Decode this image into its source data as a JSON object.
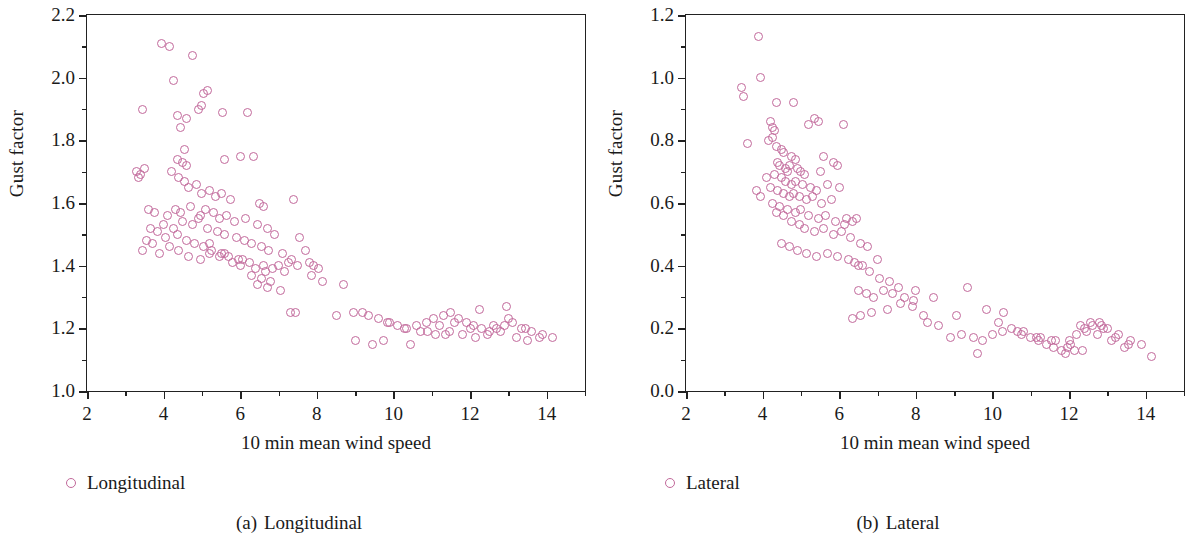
{
  "figure": {
    "marker_color": "#c2699b",
    "axis_color": "#222222"
  },
  "panels": [
    {
      "id": "a",
      "caption_number": "(a)",
      "caption_text": "Longitudinal",
      "legend_label": "Longitudinal",
      "xlabel": "10 min mean wind speed",
      "ylabel": "Gust factor",
      "xticks": [
        "2",
        "4",
        "6",
        "8",
        "10",
        "12",
        "14"
      ],
      "yticks": [
        "1.0",
        "1.2",
        "1.4",
        "1.6",
        "1.8",
        "2.0",
        "2.2"
      ]
    },
    {
      "id": "b",
      "caption_number": "(b)",
      "caption_text": "Lateral",
      "legend_label": "Lateral",
      "xlabel": "10 min mean wind speed",
      "ylabel": "Gust factor",
      "xticks": [
        "2",
        "4",
        "6",
        "8",
        "10",
        "12",
        "14"
      ],
      "yticks": [
        "0.0",
        "0.2",
        "0.4",
        "0.6",
        "0.8",
        "1.0",
        "1.2"
      ]
    }
  ],
  "chart_data": [
    {
      "type": "scatter",
      "panel": "a",
      "title": "(a) Longitudinal",
      "xlabel": "10 min mean wind speed",
      "ylabel": "Gust factor",
      "xlim": [
        2,
        15
      ],
      "ylim": [
        1.0,
        2.2
      ],
      "xticks": [
        2,
        4,
        6,
        8,
        10,
        12,
        14
      ],
      "yticks": [
        1.0,
        1.2,
        1.4,
        1.6,
        1.8,
        2.0,
        2.2
      ],
      "xminor_step": 1,
      "yminor_step": 0.1,
      "grid": false,
      "legend": [
        {
          "name": "Longitudinal",
          "marker": "open-circle",
          "color": "#c2699b"
        }
      ],
      "legend_position": "below-axis-left",
      "series": [
        {
          "name": "Longitudinal",
          "x": [
            3.95,
            4.15,
            4.75,
            5.55,
            4.25,
            5.05,
            5.15,
            3.45,
            4.9,
            5.0,
            4.6,
            4.35,
            6.2,
            4.45,
            4.55,
            3.3,
            3.4,
            4.35,
            4.5,
            4.6,
            5.6,
            6.0,
            6.35,
            3.5,
            3.35,
            4.2,
            4.4,
            4.55,
            4.65,
            4.85,
            5.0,
            5.2,
            5.35,
            5.5,
            5.75,
            6.5,
            6.6,
            7.4,
            3.6,
            3.75,
            4.1,
            4.3,
            4.45,
            4.7,
            4.95,
            5.1,
            5.3,
            5.45,
            5.65,
            5.85,
            6.15,
            6.45,
            6.7,
            6.9,
            7.55,
            3.65,
            3.85,
            4.0,
            4.25,
            4.5,
            4.75,
            4.9,
            5.15,
            5.4,
            5.6,
            5.9,
            6.1,
            6.3,
            6.55,
            6.75,
            7.1,
            7.7,
            3.55,
            3.7,
            4.05,
            4.35,
            4.6,
            4.8,
            5.05,
            5.25,
            5.5,
            5.7,
            6.05,
            6.25,
            6.6,
            6.85,
            7.25,
            7.9,
            3.45,
            3.9,
            4.15,
            4.4,
            4.65,
            4.95,
            5.2,
            5.45,
            5.8,
            6.0,
            6.4,
            6.65,
            7.0,
            7.35,
            7.8,
            8.05,
            5.2,
            5.6,
            5.95,
            6.3,
            6.55,
            6.8,
            7.15,
            7.5,
            7.85,
            8.15,
            6.45,
            6.7,
            7.05,
            7.45,
            8.7,
            8.95,
            9.35,
            9.6,
            9.85,
            10.1,
            10.35,
            10.6,
            10.85,
            11.05,
            11.3,
            11.5,
            11.7,
            11.9,
            12.1,
            12.3,
            12.5,
            12.7,
            12.9,
            13.1,
            13.35,
            13.6,
            13.9,
            14.15,
            9.0,
            9.45,
            9.9,
            10.3,
            10.7,
            11.1,
            11.45,
            11.8,
            12.15,
            12.45,
            12.8,
            13.2,
            13.5,
            13.8,
            9.75,
            10.45,
            11.2,
            11.6,
            12.0,
            12.6,
            13.0,
            13.45,
            10.9,
            11.35,
            12.25,
            12.95,
            7.3,
            8.5,
            9.2
          ],
          "y": [
            2.11,
            2.1,
            2.07,
            1.89,
            1.99,
            1.95,
            1.96,
            1.9,
            1.9,
            1.91,
            1.87,
            1.88,
            1.89,
            1.84,
            1.77,
            1.7,
            1.69,
            1.74,
            1.73,
            1.72,
            1.74,
            1.75,
            1.75,
            1.71,
            1.68,
            1.7,
            1.68,
            1.67,
            1.65,
            1.66,
            1.63,
            1.64,
            1.62,
            1.63,
            1.61,
            1.6,
            1.59,
            1.61,
            1.58,
            1.57,
            1.56,
            1.58,
            1.57,
            1.59,
            1.56,
            1.58,
            1.57,
            1.55,
            1.56,
            1.54,
            1.55,
            1.53,
            1.52,
            1.5,
            1.49,
            1.52,
            1.51,
            1.53,
            1.52,
            1.54,
            1.53,
            1.55,
            1.52,
            1.51,
            1.5,
            1.49,
            1.48,
            1.47,
            1.46,
            1.45,
            1.44,
            1.45,
            1.48,
            1.47,
            1.49,
            1.5,
            1.48,
            1.47,
            1.46,
            1.45,
            1.44,
            1.43,
            1.42,
            1.41,
            1.4,
            1.39,
            1.41,
            1.4,
            1.45,
            1.44,
            1.46,
            1.45,
            1.43,
            1.42,
            1.44,
            1.43,
            1.41,
            1.4,
            1.39,
            1.38,
            1.4,
            1.42,
            1.41,
            1.39,
            1.47,
            1.44,
            1.42,
            1.37,
            1.36,
            1.35,
            1.38,
            1.4,
            1.37,
            1.35,
            1.34,
            1.33,
            1.32,
            1.25,
            1.34,
            1.25,
            1.24,
            1.23,
            1.22,
            1.21,
            1.2,
            1.21,
            1.22,
            1.23,
            1.24,
            1.25,
            1.23,
            1.22,
            1.21,
            1.2,
            1.19,
            1.2,
            1.21,
            1.22,
            1.2,
            1.19,
            1.18,
            1.17,
            1.16,
            1.15,
            1.22,
            1.2,
            1.19,
            1.18,
            1.19,
            1.18,
            1.17,
            1.18,
            1.19,
            1.17,
            1.16,
            1.17,
            1.16,
            1.15,
            1.21,
            1.22,
            1.2,
            1.21,
            1.23,
            1.2,
            1.19,
            1.18,
            1.26,
            1.27,
            1.25,
            1.24,
            1.25,
            1.26,
            1.25
          ]
        }
      ]
    },
    {
      "type": "scatter",
      "panel": "b",
      "title": "(b) Lateral",
      "xlabel": "10 min mean wind speed",
      "ylabel": "Gust factor",
      "xlim": [
        2,
        15
      ],
      "ylim": [
        0.0,
        1.2
      ],
      "xticks": [
        2,
        4,
        6,
        8,
        10,
        12,
        14
      ],
      "yticks": [
        0.0,
        0.2,
        0.4,
        0.6,
        0.8,
        1.0,
        1.2
      ],
      "xminor_step": 1,
      "yminor_step": 0.1,
      "grid": false,
      "legend": [
        {
          "name": "Lateral",
          "marker": "open-circle",
          "color": "#c2699b"
        }
      ],
      "legend_position": "below-axis-left",
      "series": [
        {
          "name": "Lateral",
          "x": [
            3.9,
            3.95,
            3.45,
            3.5,
            4.35,
            4.8,
            5.35,
            5.45,
            6.1,
            4.2,
            4.25,
            4.3,
            3.6,
            4.25,
            5.2,
            4.15,
            4.35,
            4.5,
            4.55,
            4.75,
            4.85,
            5.6,
            5.85,
            4.4,
            4.45,
            4.6,
            4.65,
            4.7,
            4.9,
            5.0,
            5.1,
            5.5,
            5.95,
            4.1,
            4.3,
            4.5,
            4.6,
            4.75,
            4.85,
            5.05,
            5.25,
            5.4,
            5.7,
            6.0,
            3.85,
            4.2,
            4.4,
            4.55,
            4.7,
            4.8,
            4.95,
            5.15,
            5.3,
            5.55,
            5.8,
            6.2,
            6.35,
            3.95,
            4.25,
            4.45,
            4.65,
            4.85,
            5.0,
            5.2,
            5.45,
            5.65,
            5.9,
            6.15,
            6.45,
            4.35,
            4.55,
            4.75,
            4.95,
            5.1,
            5.35,
            5.6,
            5.85,
            6.05,
            6.3,
            6.55,
            4.5,
            4.7,
            4.9,
            5.15,
            5.4,
            5.7,
            5.95,
            6.25,
            6.5,
            6.75,
            7.0,
            6.4,
            6.6,
            6.8,
            7.05,
            7.3,
            7.55,
            6.5,
            6.7,
            6.9,
            7.15,
            7.4,
            7.7,
            7.95,
            8.2,
            6.35,
            6.55,
            6.85,
            7.25,
            7.6,
            7.9,
            8.3,
            8.6,
            8.9,
            9.2,
            9.5,
            9.75,
            10.0,
            10.25,
            10.5,
            10.75,
            11.0,
            11.2,
            11.4,
            11.6,
            11.8,
            12.0,
            12.2,
            12.4,
            12.6,
            12.8,
            13.0,
            13.3,
            13.6,
            13.9,
            14.15,
            9.35,
            9.85,
            10.3,
            10.8,
            11.25,
            11.65,
            12.05,
            12.45,
            12.85,
            13.2,
            13.55,
            9.6,
            10.15,
            10.65,
            11.15,
            11.55,
            11.95,
            12.35,
            12.75,
            13.1,
            13.45,
            8.0,
            8.45,
            9.05,
            12.3,
            12.55,
            12.9,
            11.9,
            12.15
          ],
          "y": [
            1.13,
            1.0,
            0.97,
            0.94,
            0.92,
            0.92,
            0.87,
            0.86,
            0.85,
            0.86,
            0.84,
            0.83,
            0.79,
            0.81,
            0.85,
            0.8,
            0.78,
            0.77,
            0.76,
            0.75,
            0.74,
            0.75,
            0.73,
            0.73,
            0.72,
            0.71,
            0.7,
            0.72,
            0.71,
            0.7,
            0.69,
            0.7,
            0.72,
            0.68,
            0.69,
            0.68,
            0.67,
            0.66,
            0.67,
            0.66,
            0.65,
            0.64,
            0.66,
            0.65,
            0.64,
            0.65,
            0.64,
            0.63,
            0.62,
            0.63,
            0.62,
            0.61,
            0.62,
            0.6,
            0.61,
            0.55,
            0.54,
            0.62,
            0.6,
            0.59,
            0.58,
            0.57,
            0.58,
            0.56,
            0.55,
            0.56,
            0.54,
            0.53,
            0.55,
            0.57,
            0.56,
            0.54,
            0.53,
            0.52,
            0.51,
            0.52,
            0.5,
            0.51,
            0.49,
            0.47,
            0.47,
            0.46,
            0.45,
            0.44,
            0.43,
            0.44,
            0.43,
            0.42,
            0.4,
            0.46,
            0.42,
            0.41,
            0.4,
            0.38,
            0.36,
            0.35,
            0.33,
            0.32,
            0.31,
            0.3,
            0.32,
            0.31,
            0.3,
            0.29,
            0.24,
            0.23,
            0.24,
            0.25,
            0.26,
            0.28,
            0.27,
            0.22,
            0.21,
            0.17,
            0.18,
            0.17,
            0.16,
            0.18,
            0.19,
            0.2,
            0.18,
            0.17,
            0.16,
            0.15,
            0.14,
            0.13,
            0.16,
            0.18,
            0.2,
            0.21,
            0.22,
            0.2,
            0.18,
            0.16,
            0.15,
            0.11,
            0.33,
            0.26,
            0.25,
            0.19,
            0.17,
            0.16,
            0.15,
            0.19,
            0.21,
            0.17,
            0.15,
            0.12,
            0.22,
            0.19,
            0.17,
            0.16,
            0.14,
            0.13,
            0.18,
            0.16,
            0.14,
            0.32,
            0.3,
            0.24,
            0.21,
            0.22,
            0.2,
            0.12,
            0.13
          ]
        }
      ]
    }
  ]
}
